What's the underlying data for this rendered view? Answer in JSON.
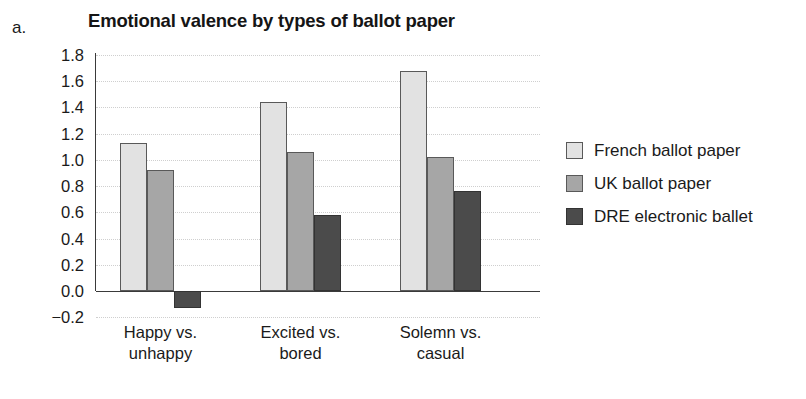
{
  "panel_letter": "a.",
  "chart_data": {
    "type": "bar",
    "title": "Emotional valence by types of ballot paper",
    "xlabel": "",
    "ylabel": "",
    "ylim": [
      -0.2,
      1.8
    ],
    "ytick_step": 0.2,
    "grid": true,
    "legend_position": "right",
    "categories": [
      "Happy vs. unhappy",
      "Excited vs. bored",
      "Solemn vs. casual"
    ],
    "category_lines": [
      [
        "Happy vs.",
        "unhappy"
      ],
      [
        "Excited vs.",
        "bored"
      ],
      [
        "Solemn vs.",
        "casual"
      ]
    ],
    "ytick_labels": [
      "1.8",
      "1.6",
      "1.4",
      "1.2",
      "1.0",
      "0.8",
      "0.6",
      "0.4",
      "0.2",
      "0.0",
      "−0.2"
    ],
    "ytick_values": [
      1.8,
      1.6,
      1.4,
      1.2,
      1.0,
      0.8,
      0.6,
      0.4,
      0.2,
      0.0,
      -0.2
    ],
    "series": [
      {
        "name": "French ballot paper",
        "color": "#e2e2e2",
        "values": [
          1.13,
          1.44,
          1.68
        ]
      },
      {
        "name": "UK ballot paper",
        "color": "#a6a6a6",
        "values": [
          0.92,
          1.06,
          1.02
        ]
      },
      {
        "name": "DRE electronic ballet",
        "color": "#4b4b4b",
        "values": [
          -0.13,
          0.58,
          0.76
        ]
      }
    ]
  },
  "legend": {
    "entries": [
      {
        "label": "French ballot paper"
      },
      {
        "label": "UK ballot paper"
      },
      {
        "label": "DRE electronic ballet"
      }
    ]
  }
}
